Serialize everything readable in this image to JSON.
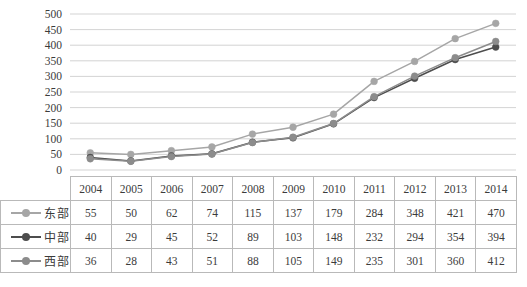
{
  "chart_data": {
    "type": "line",
    "title": "",
    "xlabel": "",
    "ylabel": "",
    "categories": [
      "2004",
      "2005",
      "2006",
      "2007",
      "2008",
      "2009",
      "2010",
      "2011",
      "2012",
      "2013",
      "2014"
    ],
    "series": [
      {
        "name": "东部",
        "color": "#a6a6a6",
        "marker": "circle",
        "values": [
          55,
          50,
          62,
          74,
          115,
          137,
          179,
          284,
          348,
          421,
          470
        ]
      },
      {
        "name": "中部",
        "color": "#4d4d4d",
        "marker": "circle",
        "values": [
          40,
          29,
          45,
          52,
          89,
          103,
          148,
          232,
          294,
          354,
          394
        ]
      },
      {
        "name": "西部",
        "color": "#8c8c8c",
        "marker": "circle",
        "values": [
          36,
          28,
          43,
          51,
          88,
          105,
          149,
          235,
          301,
          360,
          412
        ]
      }
    ],
    "ylim": [
      0,
      500
    ],
    "ytick_step": 50,
    "yticks": [
      "500",
      "450",
      "400",
      "350",
      "300",
      "250",
      "200",
      "150",
      "100",
      "50",
      "0"
    ],
    "grid": true,
    "grid_color": "#c8c8c8",
    "legend_position": "table-left"
  },
  "table": {
    "year_header": [
      "2004",
      "2005",
      "2006",
      "2007",
      "2008",
      "2009",
      "2010",
      "2011",
      "2012",
      "2013",
      "2014"
    ],
    "rows": [
      {
        "label": "东部",
        "values": [
          "55",
          "50",
          "62",
          "74",
          "115",
          "137",
          "179",
          "284",
          "348",
          "421",
          "470"
        ]
      },
      {
        "label": "中部",
        "values": [
          "40",
          "29",
          "45",
          "52",
          "89",
          "103",
          "148",
          "232",
          "294",
          "354",
          "394"
        ]
      },
      {
        "label": "西部",
        "values": [
          "36",
          "28",
          "43",
          "51",
          "88",
          "105",
          "149",
          "235",
          "301",
          "360",
          "412"
        ]
      }
    ]
  },
  "colors": {
    "east": "#a6a6a6",
    "central": "#4d4d4d",
    "west": "#8c8c8c",
    "grid": "#c8c8c8",
    "border": "#b9b9b9",
    "text": "#3b3b3b"
  }
}
